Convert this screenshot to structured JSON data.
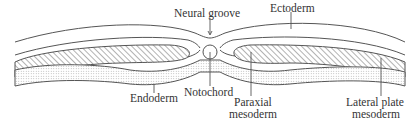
{
  "figure": {
    "type": "embryo-cross-section",
    "labels": {
      "neural_groove": "Neural groove",
      "ectoderm": "Ectoderm",
      "notochord": "Notochord",
      "endoderm": "Endoderm",
      "paraxial_line1": "Paraxial",
      "paraxial_line2": "mesoderm",
      "lateral_line1": "Lateral plate",
      "lateral_line2": "mesoderm"
    },
    "colors": {
      "stroke": "#555555",
      "text": "#333333",
      "hatch": "#666666",
      "stipple": "#9a9a9a",
      "background": "#ffffff"
    }
  }
}
